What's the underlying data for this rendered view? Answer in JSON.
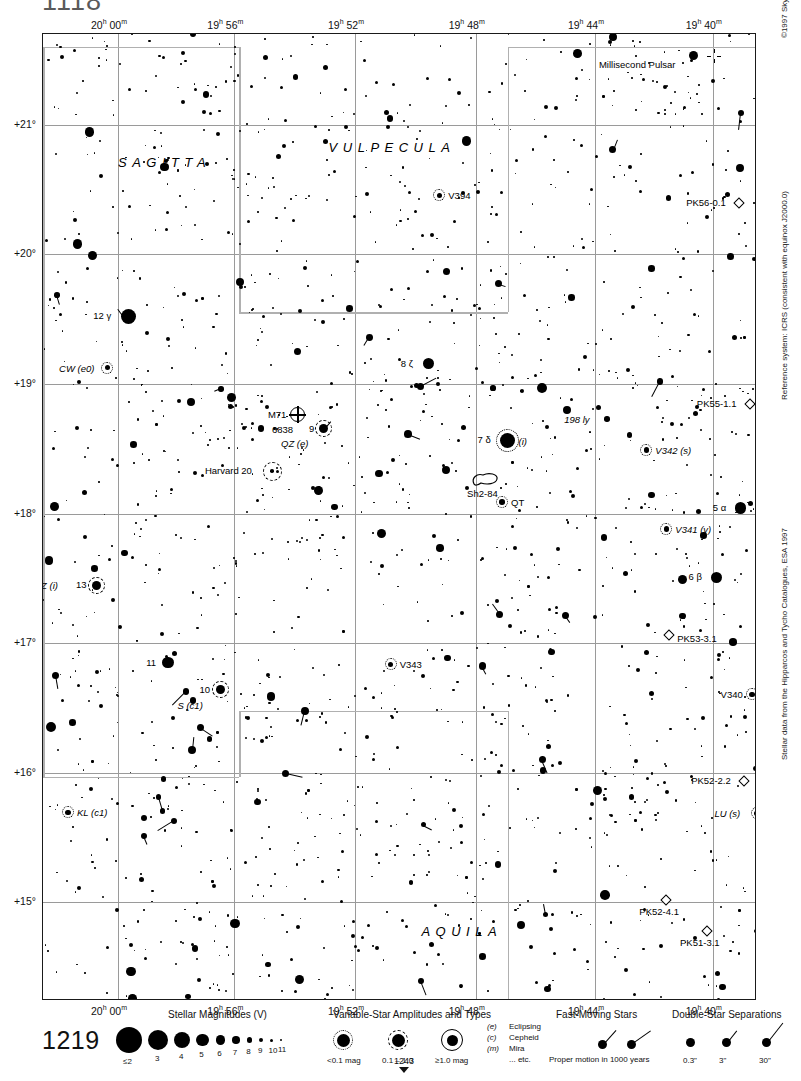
{
  "page": {
    "number_top": "1118",
    "number_legend": "1219",
    "page_marker": "1243",
    "top_caption": ""
  },
  "credits": {
    "copyright": "©1997 Sky Publishing Corporation",
    "reference_system": "Reference system: ICRS (consistent with equinox J2000.0)",
    "data_source": "Stellar data from the Hipparcos and Tycho Catalogues, ESA 1997"
  },
  "axes": {
    "ra_ticks": [
      {
        "label": "20h 00m",
        "h": "20",
        "m": "00",
        "x": 0.105
      },
      {
        "label": "19h 56m",
        "h": "19",
        "m": "56",
        "x": 0.268
      },
      {
        "label": "19h 52m",
        "h": "19",
        "m": "52",
        "x": 0.437
      },
      {
        "label": "19h 48m",
        "h": "19",
        "m": "48",
        "x": 0.606
      },
      {
        "label": "19h 44m",
        "h": "19",
        "m": "44",
        "x": 0.773
      },
      {
        "label": "19h 40m",
        "h": "19",
        "m": "40",
        "x": 0.938
      }
    ],
    "dec_ticks": [
      {
        "label": "+21°",
        "y": 0.094
      },
      {
        "label": "+20°",
        "y": 0.228
      },
      {
        "label": "+19°",
        "y": 0.362
      },
      {
        "label": "+18°",
        "y": 0.496
      },
      {
        "label": "+17°",
        "y": 0.63
      },
      {
        "label": "+16°",
        "y": 0.764
      },
      {
        "label": "+15°",
        "y": 0.898
      }
    ]
  },
  "constellations": [
    {
      "name": "SAGITTA",
      "x": 0.105,
      "y": 0.125
    },
    {
      "name": "VULPECULA",
      "x": 0.4,
      "y": 0.11
    },
    {
      "name": "AQUILA",
      "x": 0.53,
      "y": 0.92
    }
  ],
  "objects": [
    {
      "name": "Millisecond Pulsar",
      "type": "pulsar",
      "x": 0.94,
      "y": 0.023,
      "label_side": "left"
    },
    {
      "name": "PK56-0.1",
      "type": "planetary",
      "x": 0.975,
      "y": 0.175,
      "label_side": "left"
    },
    {
      "name": "PK55-1.1",
      "type": "planetary",
      "x": 0.99,
      "y": 0.383,
      "label_side": "left"
    },
    {
      "name": "PK53-3.1",
      "type": "planetary",
      "x": 0.877,
      "y": 0.622,
      "label_side": "right"
    },
    {
      "name": "PK52-2.2",
      "type": "planetary",
      "x": 0.982,
      "y": 0.773,
      "label_side": "left"
    },
    {
      "name": "PK52-4.1",
      "type": "planetary",
      "x": 0.873,
      "y": 0.896,
      "label_side": "below"
    },
    {
      "name": "PK51-3.1",
      "type": "planetary",
      "x": 0.93,
      "y": 0.928,
      "label_side": "below"
    },
    {
      "name": "M71",
      "type": "globular",
      "x": 0.357,
      "y": 0.394,
      "secondary": "6838"
    },
    {
      "name": "Harvard 20",
      "type": "opencluster",
      "x": 0.322,
      "y": 0.452
    },
    {
      "name": "Sh2-84",
      "type": "nebula",
      "x": 0.622,
      "y": 0.464
    }
  ],
  "stars": [
    {
      "label": "12 γ",
      "x": 0.12,
      "y": 0.292,
      "mag": 3.5
    },
    {
      "label": "8 ζ",
      "x": 0.54,
      "y": 0.341,
      "mag": 5.0
    },
    {
      "label": "9",
      "x": 0.393,
      "y": 0.408,
      "mag": 5.5,
      "variable": "QZ (e)"
    },
    {
      "label": "7 δ",
      "x": 0.65,
      "y": 0.42,
      "mag": 3.8,
      "note": "(i)"
    },
    {
      "label": "5 α",
      "x": 0.977,
      "y": 0.49,
      "mag": 4.4
    },
    {
      "label": "6 β",
      "x": 0.943,
      "y": 0.562,
      "mag": 4.4
    },
    {
      "label": "13",
      "x": 0.075,
      "y": 0.57,
      "mag": 5.3,
      "variable": "VZ (i)"
    },
    {
      "label": "11",
      "x": 0.175,
      "y": 0.65,
      "mag": 5.0
    },
    {
      "label": "10",
      "x": 0.248,
      "y": 0.678,
      "mag": 5.2,
      "variable": "S (c1)"
    }
  ],
  "variables": [
    {
      "label": "V394",
      "x": 0.555,
      "y": 0.167
    },
    {
      "label": "CW (e0)",
      "x": 0.09,
      "y": 0.345
    },
    {
      "label": "QZ (e)",
      "x": 0.393,
      "y": 0.423
    },
    {
      "label": "QT",
      "x": 0.643,
      "y": 0.484
    },
    {
      "label": "V342 (s)",
      "x": 0.845,
      "y": 0.43
    },
    {
      "label": "V341 (v)",
      "x": 0.873,
      "y": 0.512
    },
    {
      "label": "V343",
      "x": 0.487,
      "y": 0.652
    },
    {
      "label": "V340",
      "x": 0.993,
      "y": 0.683
    },
    {
      "label": "LU (s)",
      "x": 1.0,
      "y": 0.806
    },
    {
      "label": "S (c1)",
      "x": 0.248,
      "y": 0.694
    },
    {
      "label": "KL (c1)",
      "x": 0.035,
      "y": 0.805
    },
    {
      "label": "VZ (i)",
      "x": 0.048,
      "y": 0.57
    }
  ],
  "annotations": [
    {
      "label": "198 ly",
      "x": 0.79,
      "y": 0.398
    }
  ],
  "legend": {
    "magnitudes": {
      "title": "Stellar Magnitudes (V)",
      "items": [
        {
          "label": "≤2",
          "d": 26
        },
        {
          "label": "3",
          "d": 20
        },
        {
          "label": "4",
          "d": 16
        },
        {
          "label": "5",
          "d": 12.5
        },
        {
          "label": "6",
          "d": 9.5
        },
        {
          "label": "7",
          "d": 7.5
        },
        {
          "label": "8",
          "d": 5.5
        },
        {
          "label": "9",
          "d": 4
        },
        {
          "label": "10",
          "d": 3
        },
        {
          "label": "11",
          "d": 2
        }
      ]
    },
    "variables": {
      "title": "Variable-Star Amplitudes and Types",
      "items": [
        {
          "label": "<0.1 mag",
          "ring": "dotted"
        },
        {
          "label": "0.1 – 1.0",
          "ring": "dashed"
        },
        {
          "label": "≥1.0 mag",
          "ring": "solid"
        }
      ],
      "types": [
        {
          "code": "(e)",
          "name": "Eclipsing"
        },
        {
          "code": "(c)",
          "name": "Cepheid"
        },
        {
          "code": "(m)",
          "name": "Mira"
        },
        {
          "code": "",
          "name": "... etc."
        }
      ]
    },
    "fast_moving": {
      "title": "Fast-Moving Stars",
      "caption": "Proper motion in 1000 years"
    },
    "doubles": {
      "title": "Double-Star Separations",
      "items": [
        {
          "label": "0.3\"",
          "len": 0
        },
        {
          "label": "3\"",
          "len": 12
        },
        {
          "label": "30\"",
          "len": 22
        }
      ]
    }
  }
}
